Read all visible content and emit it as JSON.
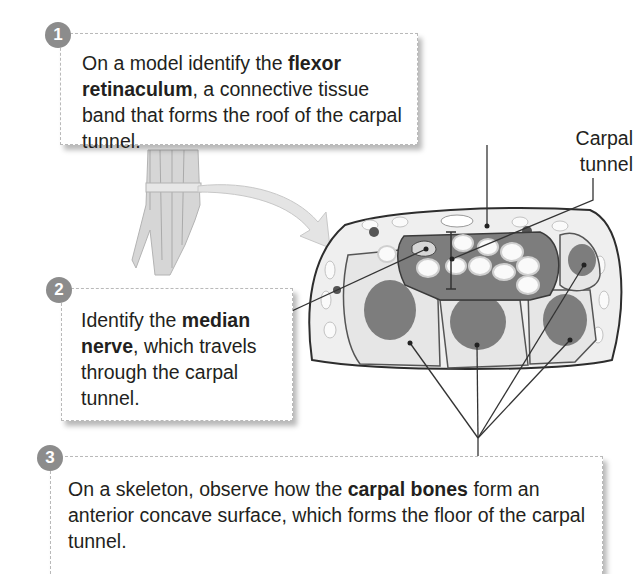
{
  "steps": [
    {
      "number": "1",
      "text_before": "On a model identify the ",
      "bold": "flexor retinaculum",
      "text_after": ", a connective tissue band that forms the roof of the carpal tunnel."
    },
    {
      "number": "2",
      "text_before": "Identify the ",
      "bold": "median nerve",
      "text_after": ", which travels through the carpal tunnel."
    },
    {
      "number": "3",
      "text_before": "On a skeleton, observe how the ",
      "bold": "carpal bones",
      "text_after": " form an anterior concave surface, which forms the floor of the carpal tunnel."
    }
  ],
  "labels": {
    "carpal_tunnel_line1": "Carpal",
    "carpal_tunnel_line2": "tunnel"
  },
  "colors": {
    "badge": "#8c8c8c",
    "tunnel_fill": "#7d7d7d",
    "bone_fill": "#e6e6e6",
    "leader": "#333333"
  }
}
